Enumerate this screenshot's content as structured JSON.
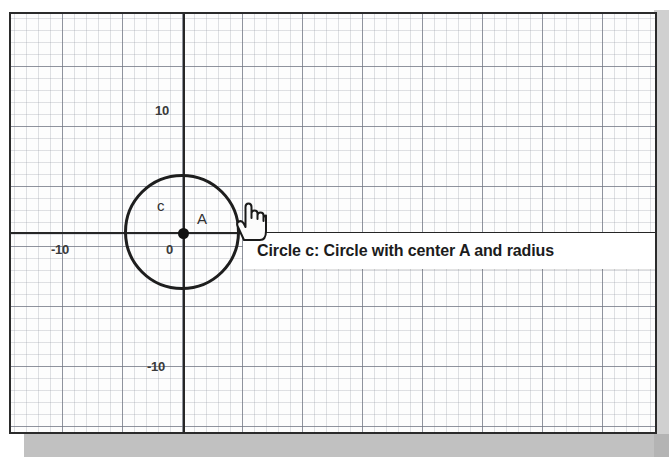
{
  "app": {
    "view_name": "Graphics View"
  },
  "graph": {
    "axes": {
      "x_axis_label": "x-axis",
      "y_axis_label": "y-axis",
      "tick_labels": {
        "y_positive": "10",
        "y_negative": "-10",
        "x_negative": "-10",
        "origin": "0"
      }
    },
    "grid": {
      "minor_visible": true,
      "major_visible": true,
      "minor_spacing_px": 12,
      "major_spacing_px": 60
    },
    "objects": [
      {
        "type": "circle",
        "label": "c",
        "center_label": "A",
        "center_value": "0",
        "radius_units": 5
      },
      {
        "type": "point",
        "label": "A"
      }
    ]
  },
  "tooltip": {
    "prefix": "Circle ",
    "object_name": "c",
    "suffix": ": Circle with center A and radius",
    "full_text": "Circle c: Circle with center A and radius"
  },
  "cursor": {
    "icon": "hand-pointer-icon"
  },
  "colors": {
    "axis": "#262626",
    "object_stroke": "#1e1e1e",
    "grid_major": "#6e7380",
    "grid_minor": "#969baa",
    "tooltip_background": "#ffffff",
    "tooltip_text": "#1c1c1c",
    "frame_border": "#2b2b2b",
    "panel_band": "#a9a9a9"
  }
}
